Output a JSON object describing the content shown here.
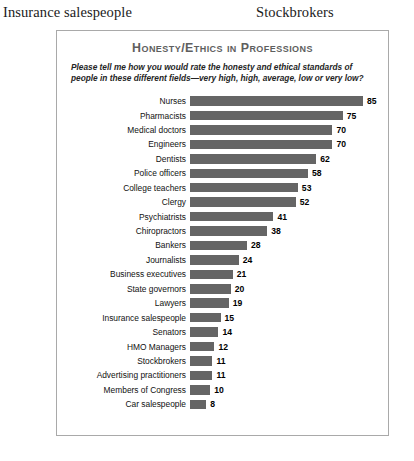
{
  "page_headers": {
    "left": "Insurance salespeople",
    "right": "Stockbrokers"
  },
  "chart_panel": {
    "title": "Honesty/Ethics in Professions",
    "subtitle": "Please tell me how you would rate the honesty and ethical standards of people in these different fields—very high, high, average, low or very low?",
    "bar_color": "#656565",
    "border_color": "#a9a9a9",
    "title_color": "#5e5e5e"
  },
  "chart_data": {
    "type": "bar",
    "orientation": "horizontal",
    "title": "Honesty/Ethics in Professions",
    "subtitle": "Please tell me how you would rate the honesty and ethical standards of people in these different fields—very high, high, average, low or very low?",
    "xlabel": "",
    "ylabel": "",
    "xlim": [
      0,
      85
    ],
    "grid": false,
    "legend": null,
    "categories": [
      "Nurses",
      "Pharmacists",
      "Medical doctors",
      "Engineers",
      "Dentists",
      "Police officers",
      "College teachers",
      "Clergy",
      "Psychiatrists",
      "Chiropractors",
      "Bankers",
      "Journalists",
      "Business executives",
      "State governors",
      "Lawyers",
      "Insurance salespeople",
      "Senators",
      "HMO Managers",
      "Stockbrokers",
      "Advertising practitioners",
      "Members of Congress",
      "Car salespeople"
    ],
    "values": [
      85,
      75,
      70,
      70,
      62,
      58,
      53,
      52,
      41,
      38,
      28,
      24,
      21,
      20,
      19,
      15,
      14,
      12,
      11,
      11,
      10,
      8
    ]
  }
}
